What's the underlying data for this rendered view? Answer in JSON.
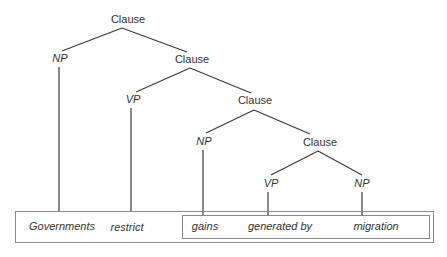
{
  "diagram": {
    "type": "syntax-tree",
    "nodes": {
      "clause_root": "Clause",
      "np_subject": "NP",
      "clause_2": "Clause",
      "vp_1": "VP",
      "clause_3": "Clause",
      "np_object": "NP",
      "clause_4": "Clause",
      "vp_2": "VP",
      "np_agent": "NP"
    },
    "words": {
      "w1": "Governments",
      "w2": "restrict",
      "w3": "gains",
      "w4": "generated by",
      "w5": "migration"
    },
    "edges": [
      [
        "Clause",
        "NP"
      ],
      [
        "Clause",
        "Clause"
      ],
      [
        "NP",
        "Governments"
      ],
      [
        "Clause",
        "VP"
      ],
      [
        "Clause",
        "Clause"
      ],
      [
        "VP",
        "restrict"
      ],
      [
        "Clause",
        "NP"
      ],
      [
        "Clause",
        "Clause"
      ],
      [
        "NP",
        "gains"
      ],
      [
        "Clause",
        "VP"
      ],
      [
        "Clause",
        "NP"
      ],
      [
        "VP",
        "generated by"
      ],
      [
        "NP",
        "migration"
      ]
    ],
    "line_color": "#3a3a3a",
    "box_color": "#8a8a8a"
  }
}
